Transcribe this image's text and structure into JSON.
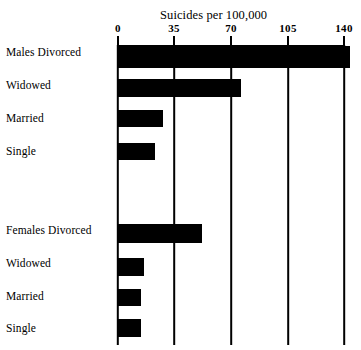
{
  "chart_data": {
    "type": "bar",
    "orientation": "horizontal",
    "title": "Suicides per 100,000",
    "xlabel": "",
    "ylabel": "",
    "xlim": [
      0,
      140
    ],
    "xticks": [
      0,
      35,
      70,
      105,
      140
    ],
    "xtick_labels": [
      "0",
      "35",
      "70",
      "105",
      "140"
    ],
    "grid": true,
    "legend": false,
    "bar_color": "#000000",
    "background_color": "#ffffff",
    "groups": [
      {
        "name": "Males",
        "categories": [
          "Males Divorced",
          "Widowed",
          "Married",
          "Single"
        ],
        "values": [
          144,
          76,
          28,
          23
        ]
      },
      {
        "name": "Females",
        "categories": [
          "Females Divorced",
          "Widowed",
          "Married",
          "Single"
        ],
        "values": [
          52,
          16,
          14,
          14
        ]
      }
    ],
    "categories": [
      "Males Divorced",
      "Widowed",
      "Married",
      "Single",
      "Females Divorced",
      "Widowed",
      "Married",
      "Single"
    ],
    "values": [
      144,
      76,
      28,
      23,
      52,
      16,
      14,
      14
    ]
  },
  "axis": {
    "ticks": [
      {
        "label": "0",
        "value": 0
      },
      {
        "label": "35",
        "value": 35
      },
      {
        "label": "70",
        "value": 70
      },
      {
        "label": "105",
        "value": 105
      },
      {
        "label": "140",
        "value": 140
      }
    ]
  },
  "rows": [
    {
      "label": "Males Divorced",
      "value": 144,
      "top": 46,
      "height": 22
    },
    {
      "label": "Widowed",
      "value": 76,
      "top": 79,
      "height": 18
    },
    {
      "label": "Married",
      "value": 28,
      "top": 110,
      "height": 17
    },
    {
      "label": "Single",
      "value": 23,
      "top": 143,
      "height": 17
    },
    {
      "label": "Females Divorced",
      "value": 52,
      "top": 224,
      "height": 19
    },
    {
      "label": "Widowed",
      "value": 16,
      "top": 258,
      "height": 18
    },
    {
      "label": "Married",
      "value": 14,
      "top": 289,
      "height": 17
    },
    {
      "label": "Single",
      "value": 14,
      "top": 319,
      "height": 18
    }
  ],
  "label_positions": [
    {
      "top": 46
    },
    {
      "top": 79
    },
    {
      "top": 112
    },
    {
      "top": 145
    },
    {
      "top": 224
    },
    {
      "top": 257
    },
    {
      "top": 290
    },
    {
      "top": 322
    }
  ]
}
